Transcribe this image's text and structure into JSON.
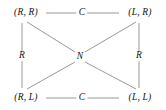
{
  "figure": {
    "type": "graph-diagram",
    "background_color": "#ffffff",
    "line_color": "#8c8c8c",
    "text_color": "#141414"
  },
  "nodes": {
    "top_left": {
      "label": "(R, R)",
      "x": 26,
      "y": 13
    },
    "top_right": {
      "label": "(L, R)",
      "x": 140,
      "y": 13
    },
    "bottom_left": {
      "label": "(R, L)",
      "x": 26,
      "y": 98
    },
    "bottom_right": {
      "label": "(L, L)",
      "x": 140,
      "y": 98
    },
    "center": {
      "label": "N",
      "x": 80,
      "y": 57
    }
  },
  "edge_labels": {
    "top": {
      "label": "C",
      "x": 82,
      "y": 13
    },
    "bottom": {
      "label": "C",
      "x": 82,
      "y": 98
    },
    "left": {
      "label": "R",
      "x": 22,
      "y": 56
    },
    "right": {
      "label": "R",
      "x": 139,
      "y": 56
    }
  },
  "edges": [
    {
      "name": "top-horizontal",
      "from": "top_left",
      "to": "top_right",
      "label": "C"
    },
    {
      "name": "bottom-horizontal",
      "from": "bottom_left",
      "to": "bottom_right",
      "label": "C"
    },
    {
      "name": "left-vertical",
      "from": "top_left",
      "to": "bottom_left",
      "label": "R"
    },
    {
      "name": "right-vertical",
      "from": "top_right",
      "to": "bottom_right",
      "label": "R"
    },
    {
      "name": "diagonal-top-left-center",
      "from": "top_left",
      "to": "center",
      "label": ""
    },
    {
      "name": "diagonal-top-right-center",
      "from": "top_right",
      "to": "center",
      "label": ""
    },
    {
      "name": "diagonal-bottom-left-center",
      "from": "bottom_left",
      "to": "center",
      "label": ""
    },
    {
      "name": "diagonal-bottom-right-center",
      "from": "bottom_right",
      "to": "center",
      "label": ""
    }
  ]
}
